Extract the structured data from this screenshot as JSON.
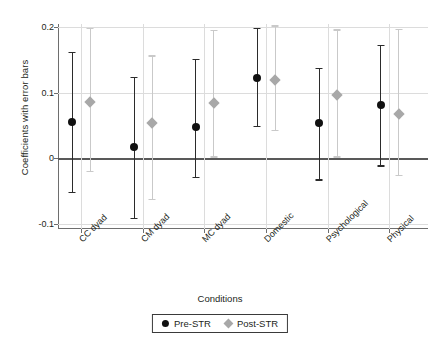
{
  "chart_data": {
    "type": "scatter",
    "title": "",
    "xlabel": "Conditions",
    "ylabel": "Coefficients with error bars",
    "categories": [
      "CC dyad",
      "CM dyad",
      "MC dyad",
      "Domestic",
      "Psychological",
      "Physical"
    ],
    "ylim": [
      -0.108,
      0.205
    ],
    "yticks": [
      0.2,
      0.1,
      0,
      -0.1
    ],
    "ytick_labels": [
      "0.2",
      "0.1",
      "0",
      "-0.1"
    ],
    "grid": true,
    "legend_title": "Conditions",
    "legend_position": "bottom",
    "zero_reference_line": 0,
    "series": [
      {
        "name": "Pre-STR",
        "marker": "circle",
        "color": "#111111",
        "values": [
          0.055,
          0.017,
          0.047,
          0.122,
          0.054,
          0.081
        ],
        "ci_low": [
          -0.051,
          -0.091,
          -0.028,
          0.05,
          -0.032,
          -0.011
        ],
        "ci_high": [
          0.162,
          0.124,
          0.152,
          0.199,
          0.138,
          0.173
        ]
      },
      {
        "name": "Post-STR",
        "marker": "diamond",
        "color": "#a8a8a8",
        "values": [
          0.086,
          0.054,
          0.085,
          0.119,
          0.096,
          0.068
        ],
        "ci_low": [
          -0.019,
          -0.062,
          0.003,
          0.043,
          0.003,
          -0.025
        ],
        "ci_high": [
          0.199,
          0.157,
          0.196,
          0.203,
          0.197,
          0.198
        ]
      }
    ]
  },
  "legend": {
    "title": "Conditions",
    "entries": [
      {
        "label": "Pre-STR",
        "icon": "filled-circle-marker"
      },
      {
        "label": "Post-STR",
        "icon": "filled-diamond-marker"
      }
    ]
  }
}
